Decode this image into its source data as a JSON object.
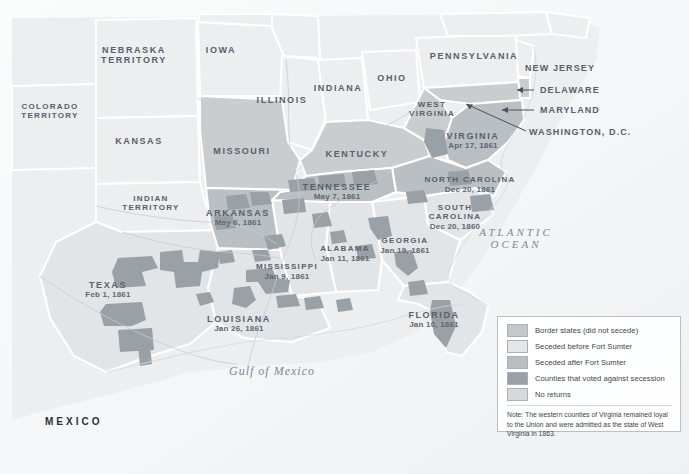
{
  "map": {
    "title": "Secession of the Southern States, 1860-1861",
    "colors": {
      "border_state": "#c9cdd0",
      "seceded_before_sumter": "#e2e5e7",
      "seceded_after_sumter": "#b9bfc3",
      "counties_against": "#9aa1a6",
      "no_returns": "#d6dadd",
      "union_free": "#eceeef",
      "water": "#f4f6f7",
      "label": "#57606a"
    },
    "states": [
      {
        "name": "NEBRASKA\nTERRITORY",
        "date": "",
        "x": 134,
        "y": 52
      },
      {
        "name": "IOWA",
        "date": "",
        "x": 221,
        "y": 52
      },
      {
        "name": "COLORADO\nTERRITORY",
        "date": "",
        "x": 50,
        "y": 110
      },
      {
        "name": "KANSAS",
        "date": "",
        "x": 139,
        "y": 142
      },
      {
        "name": "MISSOURI",
        "date": "",
        "x": 242,
        "y": 152
      },
      {
        "name": "ILLINOIS",
        "date": "",
        "x": 282,
        "y": 101
      },
      {
        "name": "INDIANA",
        "date": "",
        "x": 338,
        "y": 89
      },
      {
        "name": "OHIO",
        "date": "",
        "x": 392,
        "y": 79
      },
      {
        "name": "PENNSYLVANIA",
        "date": "",
        "x": 474,
        "y": 57
      },
      {
        "name": "KENTUCKY",
        "date": "",
        "x": 357,
        "y": 155
      },
      {
        "name": "WEST\nVIRGINIA",
        "date": "",
        "x": 432,
        "y": 108
      },
      {
        "name": "VIRGINIA",
        "date": "Apr 17, 1861",
        "x": 473,
        "y": 137
      },
      {
        "name": "TENNESSEE",
        "date": "May 7, 1861",
        "x": 337,
        "y": 188
      },
      {
        "name": "NORTH CAROLINA",
        "date": "Dec 20, 1861",
        "x": 470,
        "y": 182
      },
      {
        "name": "SOUTH\nCAROLINA",
        "date": "Dec 20, 1860",
        "x": 455,
        "y": 212
      },
      {
        "name": "ARKANSAS",
        "date": "May 6, 1861",
        "x": 238,
        "y": 214
      },
      {
        "name": "INDIAN\nTERRITORY",
        "date": "",
        "x": 150,
        "y": 202
      },
      {
        "name": "ALABAMA",
        "date": "Jan 11, 1861",
        "x": 345,
        "y": 251
      },
      {
        "name": "GEORGIA",
        "date": "Jan 19, 1861",
        "x": 404,
        "y": 243
      },
      {
        "name": "MISSISSIPPI",
        "date": "Jan 9, 1861",
        "x": 287,
        "y": 269
      },
      {
        "name": "LOUISIANA",
        "date": "Jan 26, 1861",
        "x": 239,
        "y": 320
      },
      {
        "name": "TEXAS",
        "date": "Feb 1, 1861",
        "x": 108,
        "y": 286
      },
      {
        "name": "FLORIDA",
        "date": "Jan 10, 1861",
        "x": 434,
        "y": 316
      }
    ],
    "callouts": [
      {
        "name": "NEW JERSEY",
        "x": 525,
        "y": 68
      },
      {
        "name": "DELAWARE",
        "x": 540,
        "y": 90
      },
      {
        "name": "MARYLAND",
        "x": 540,
        "y": 110
      },
      {
        "name": "WASHINGTON, D.C.",
        "x": 529,
        "y": 132
      }
    ],
    "water_labels": [
      {
        "name": "ATLANTIC\nOCEAN",
        "x": 516,
        "y": 232,
        "style": "ocean"
      },
      {
        "name": "Gulf of Mexico",
        "x": 272,
        "y": 371,
        "style": "gulf"
      }
    ],
    "country_labels": [
      {
        "name": "MEXICO",
        "x": 45,
        "y": 421
      }
    ]
  },
  "legend": {
    "items": [
      {
        "label": "Border states (did not secede)",
        "color": "#c3c8cc"
      },
      {
        "label": "Seceded before Fort Sumter",
        "color": "#e4e7e9"
      },
      {
        "label": "Seceded after Fort Sumter",
        "color": "#b8bec2"
      },
      {
        "label": "Counties that voted against secession",
        "color": "#9aa1a6"
      },
      {
        "label": "No returns",
        "color": "#d5d9dc"
      }
    ],
    "note": "Note: The western counties of Virginia remained loyal to the Union and were admitted as the state of West Virginia in 1863."
  }
}
